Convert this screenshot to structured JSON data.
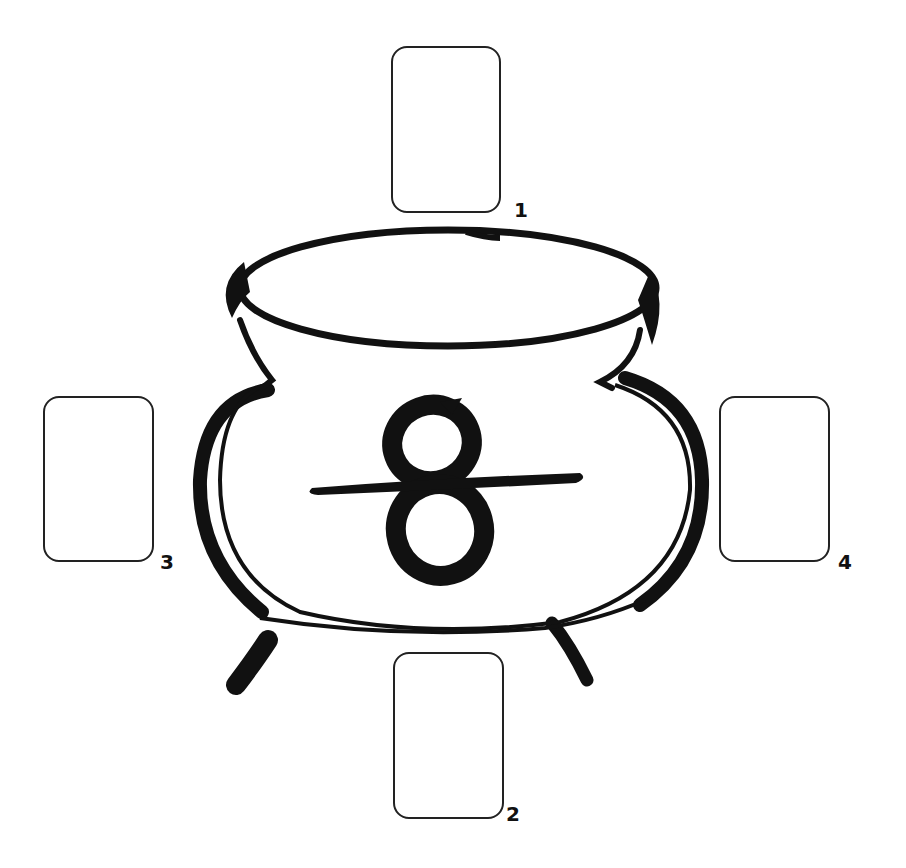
{
  "diagram": {
    "type": "tarot-spread",
    "centerpiece": {
      "name": "cauldron",
      "symbol": "8"
    },
    "colors": {
      "ink": "#111111",
      "card_border": "#222222",
      "background": "#ffffff"
    },
    "cards": [
      {
        "label": "1",
        "x": 391,
        "y": 46,
        "w": 110,
        "h": 167,
        "label_x": 514,
        "label_y": 200
      },
      {
        "label": "2",
        "x": 393,
        "y": 652,
        "w": 111,
        "h": 167,
        "label_x": 506,
        "label_y": 804
      },
      {
        "label": "3",
        "x": 43,
        "y": 396,
        "w": 111,
        "h": 166,
        "label_x": 160,
        "label_y": 552
      },
      {
        "label": "4",
        "x": 719,
        "y": 396,
        "w": 111,
        "h": 166,
        "label_x": 838,
        "label_y": 552
      }
    ]
  }
}
